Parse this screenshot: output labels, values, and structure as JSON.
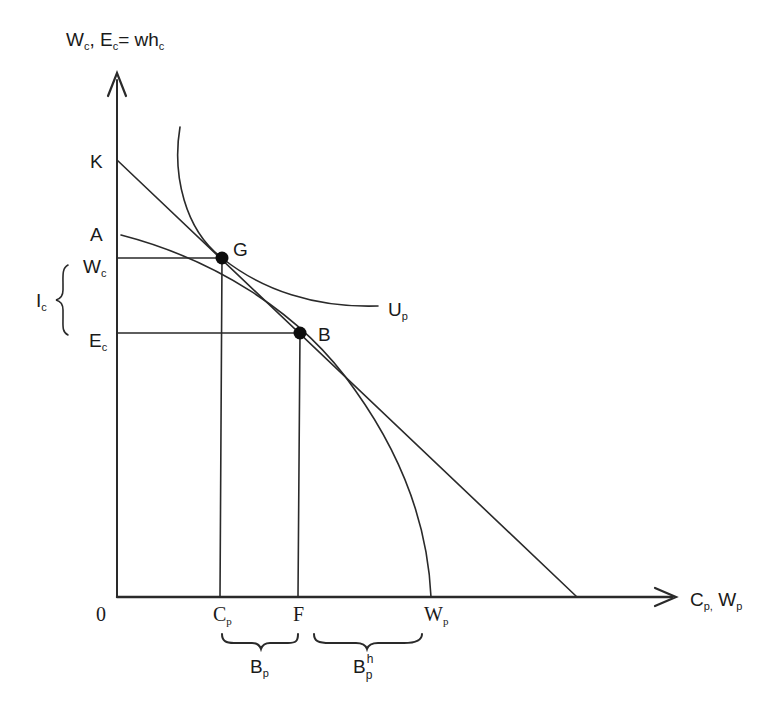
{
  "diagram": {
    "y_axis_label": {
      "main": "W",
      "sub1": "c",
      "sep": ", E",
      "sub2": "c",
      "eq": "= wh",
      "sub3": "c"
    },
    "x_axis_label": {
      "main": "C",
      "sub1": "p,",
      "sep": " W",
      "sub2": "p"
    },
    "origin_label": "0",
    "points": {
      "K": {
        "label": "K"
      },
      "A": {
        "label": "A"
      },
      "G": {
        "label": "G"
      },
      "B": {
        "label": "B"
      },
      "Wc": {
        "main": "W",
        "sub": "c"
      },
      "Ec": {
        "main": "E",
        "sub": "c"
      },
      "Cp": {
        "main": "C",
        "sub": "p"
      },
      "F": {
        "label": "F"
      },
      "Wp": {
        "main": "W",
        "sub": "p"
      }
    },
    "curves": {
      "Up": {
        "main": "U",
        "sub": "p"
      }
    },
    "braces": {
      "Ic": {
        "main": "I",
        "sub": "c"
      },
      "Bp": {
        "main": "B",
        "sub": "p"
      },
      "Bph": {
        "main": "B",
        "sub": "p",
        "sup": "h"
      }
    },
    "colors": {
      "line": "#2a2a2a",
      "dot": "#0d0d0d",
      "text": "#1a1a1a"
    }
  }
}
